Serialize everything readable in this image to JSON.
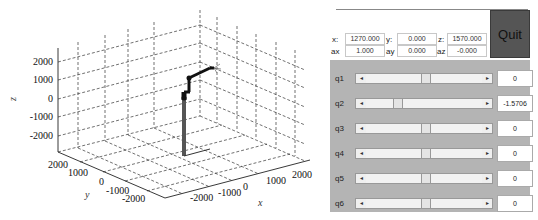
{
  "plot": {
    "axes": {
      "x_label": "x",
      "y_label": "y",
      "z_label": "z",
      "x_ticks": [
        "-2000",
        "-1000",
        "0",
        "1000",
        "2000"
      ],
      "y_ticks": [
        "2000",
        "1000",
        "0",
        "-1000",
        "-2000"
      ],
      "z_ticks": [
        "2000",
        "1000",
        "0",
        "-1000",
        "-2000"
      ]
    },
    "grid": "dashed"
  },
  "panel": {
    "pose": {
      "x_label": "x:",
      "x_value": "1270.000",
      "y_label": "y:",
      "y_value": "0.000",
      "z_label": "z:",
      "z_value": "1570.000",
      "ax_label": "ax",
      "ax_value": "1.000",
      "ay_label": "ay",
      "ay_value": "0.000",
      "az_label": "az",
      "az_value": "-0.000"
    },
    "quit_label": "Quit",
    "joints": [
      {
        "label": "q1",
        "value": "0",
        "thumb_pct": 50
      },
      {
        "label": "q2",
        "value": "-1.5706",
        "thumb_pct": 25
      },
      {
        "label": "q3",
        "value": "0",
        "thumb_pct": 50
      },
      {
        "label": "q4",
        "value": "0",
        "thumb_pct": 50
      },
      {
        "label": "q5",
        "value": "0",
        "thumb_pct": 50
      },
      {
        "label": "q6",
        "value": "0",
        "thumb_pct": 50
      }
    ],
    "arrow_left": "◂",
    "arrow_right": "▸"
  }
}
